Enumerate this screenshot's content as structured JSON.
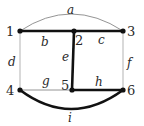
{
  "graph": {
    "nodes": [
      {
        "id": "1",
        "label": "1"
      },
      {
        "id": "2",
        "label": "2"
      },
      {
        "id": "3",
        "label": "3"
      },
      {
        "id": "4",
        "label": "4"
      },
      {
        "id": "5",
        "label": "5"
      },
      {
        "id": "6",
        "label": "6"
      }
    ],
    "edges": [
      {
        "id": "a",
        "label": "a",
        "from": "1",
        "to": "3",
        "highlighted": false,
        "shape": "arc-above"
      },
      {
        "id": "b",
        "label": "b",
        "from": "1",
        "to": "2",
        "highlighted": true,
        "shape": "straight"
      },
      {
        "id": "c",
        "label": "c",
        "from": "2",
        "to": "3",
        "highlighted": true,
        "shape": "straight"
      },
      {
        "id": "d",
        "label": "d",
        "from": "1",
        "to": "4",
        "highlighted": false,
        "shape": "straight"
      },
      {
        "id": "e",
        "label": "e",
        "from": "2",
        "to": "5",
        "highlighted": true,
        "shape": "straight"
      },
      {
        "id": "f",
        "label": "f",
        "from": "3",
        "to": "6",
        "highlighted": false,
        "shape": "straight"
      },
      {
        "id": "g",
        "label": "g",
        "from": "4",
        "to": "5",
        "highlighted": false,
        "shape": "straight"
      },
      {
        "id": "h",
        "label": "h",
        "from": "5",
        "to": "6",
        "highlighted": true,
        "shape": "straight"
      },
      {
        "id": "i",
        "label": "i",
        "from": "4",
        "to": "6",
        "highlighted": true,
        "shape": "arc-below"
      }
    ],
    "colors": {
      "highlighted_edge": "#111111",
      "normal_edge": "#888888",
      "node": "#111111"
    }
  }
}
